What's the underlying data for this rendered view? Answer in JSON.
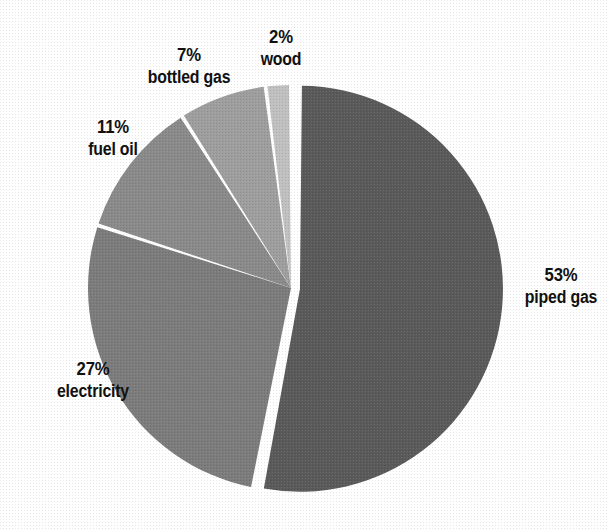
{
  "chart_data": {
    "type": "pie",
    "title": "",
    "subtitle": "",
    "xlabel": "",
    "ylabel": "",
    "legend": "none",
    "grid": false,
    "value_unit": "percent",
    "total": 100,
    "start_angle_deg": 0,
    "direction": "clockwise",
    "categories": [
      "piped gas",
      "electricity",
      "fuel oil",
      "bottled gas",
      "wood"
    ],
    "values": [
      53,
      27,
      11,
      7,
      2
    ],
    "slices": [
      {
        "label": "piped gas",
        "value": 53,
        "percent_text": "53%",
        "color": "#5a5a5a",
        "exploded": true,
        "label_position": "right"
      },
      {
        "label": "electricity",
        "value": 27,
        "percent_text": "27%",
        "color": "#7c7c7c",
        "exploded": false,
        "label_position": "bottom-left"
      },
      {
        "label": "fuel oil",
        "value": 11,
        "percent_text": "11%",
        "color": "#8a8a8a",
        "exploded": false,
        "label_position": "left"
      },
      {
        "label": "bottled gas",
        "value": 7,
        "percent_text": "7%",
        "color": "#9e9e9e",
        "exploded": false,
        "label_position": "top-left"
      },
      {
        "label": "wood",
        "value": 2,
        "percent_text": "2%",
        "color": "#c0c0c0",
        "exploded": false,
        "label_position": "top"
      }
    ]
  },
  "labels": {
    "piped_gas": {
      "pct": "53%",
      "cat": "piped gas"
    },
    "electricity": {
      "pct": "27%",
      "cat": "electricity"
    },
    "fuel_oil": {
      "pct": "11%",
      "cat": "fuel oil"
    },
    "bottled_gas": {
      "pct": "7%",
      "cat": "bottled gas"
    },
    "wood": {
      "pct": "2%",
      "cat": "wood"
    }
  },
  "colors": {
    "background": "#ffffff",
    "text": "#111111",
    "piped_gas": "#5a5a5a",
    "electricity": "#7c7c7c",
    "fuel_oil": "#8a8a8a",
    "bottled_gas": "#9e9e9e",
    "wood": "#c0c0c0",
    "separator": "#ffffff"
  }
}
